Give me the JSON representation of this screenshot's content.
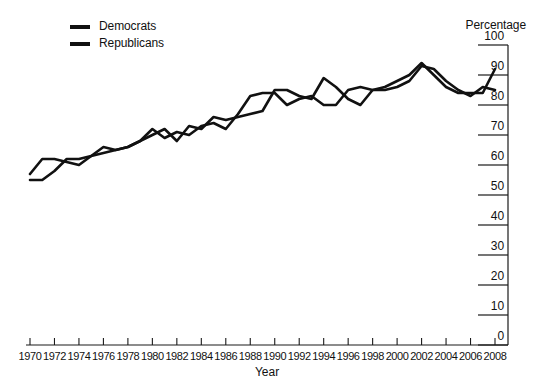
{
  "legend": {
    "position": "top-left",
    "items": [
      {
        "label": "Democrats",
        "color": "#111111"
      },
      {
        "label": "Republicans",
        "color": "#111111"
      }
    ]
  },
  "axis_titles": {
    "y": "Percentage",
    "x": "Year"
  },
  "chart_data": {
    "type": "line",
    "title": "",
    "subtitle": "",
    "xlabel": "Year",
    "ylabel": "Percentage",
    "xlim": [
      1970,
      2008
    ],
    "ylim": [
      0,
      100
    ],
    "grid": false,
    "legend_position": "top-left",
    "y_ticks": [
      0,
      10,
      20,
      30,
      40,
      50,
      60,
      70,
      80,
      90,
      100
    ],
    "x_ticks": [
      1970,
      1972,
      1974,
      1976,
      1978,
      1980,
      1982,
      1984,
      1986,
      1988,
      1990,
      1992,
      1994,
      1996,
      1998,
      2000,
      2002,
      2004,
      2006,
      2008
    ],
    "x": [
      1970,
      1971,
      1972,
      1973,
      1974,
      1975,
      1976,
      1977,
      1978,
      1979,
      1980,
      1981,
      1982,
      1983,
      1984,
      1985,
      1986,
      1987,
      1988,
      1989,
      1990,
      1991,
      1992,
      1993,
      1994,
      1995,
      1996,
      1997,
      1998,
      1999,
      2000,
      2001,
      2002,
      2003,
      2004,
      2005,
      2006,
      2007,
      2008
    ],
    "series": [
      {
        "name": "Democrats",
        "color": "#111111",
        "values": [
          57,
          62,
          62,
          61,
          60,
          63,
          64,
          65,
          66,
          68,
          72,
          69,
          71,
          70,
          73,
          74,
          72,
          77,
          83,
          84,
          84,
          80,
          82,
          83,
          80,
          80,
          85,
          86,
          85,
          86,
          88,
          90,
          94,
          90,
          86,
          84,
          84,
          84,
          92
        ]
      },
      {
        "name": "Republicans",
        "color": "#111111",
        "values": [
          55,
          55,
          58,
          62,
          62,
          63,
          66,
          65,
          66,
          68,
          70,
          72,
          68,
          73,
          72,
          76,
          75,
          76,
          77,
          78,
          85,
          85,
          83,
          82,
          89,
          86,
          82,
          80,
          85,
          85,
          86,
          88,
          93,
          92,
          88,
          85,
          83,
          86,
          85
        ]
      }
    ]
  }
}
